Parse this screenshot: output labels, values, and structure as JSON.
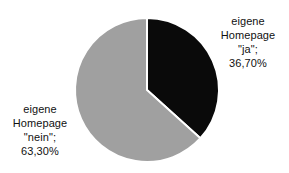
{
  "chart_data": {
    "type": "pie",
    "title": "",
    "subtitle": "",
    "xlabel": "",
    "ylabel": "",
    "grid": false,
    "legend_position": "none",
    "label_style": "callout-text-outside",
    "start_angle_deg": 0,
    "direction": "clockwise",
    "categories": [
      "eigene Homepage \"ja\"",
      "eigene Homepage \"nein\""
    ],
    "values": [
      36.7,
      63.3
    ],
    "value_suffix": "%",
    "decimal_separator": ",",
    "slices": [
      {
        "name": "eigene Homepage \"ja\"",
        "value": 36.7,
        "value_text": "36,70%",
        "color": "#0a0a0a",
        "start_deg": 0,
        "end_deg": 132.12,
        "label_lines": [
          "eigene",
          "Homepage",
          "\"ja\";",
          "36,70%"
        ],
        "label_position": "right"
      },
      {
        "name": "eigene Homepage \"nein\"",
        "value": 63.3,
        "value_text": "63,30%",
        "color": "#a0a0a0",
        "start_deg": 132.12,
        "end_deg": 360,
        "label_lines": [
          "eigene",
          "Homepage",
          "\"nein\";",
          "63,30%"
        ],
        "label_position": "left"
      }
    ]
  },
  "colors": {
    "background": "#ffffff",
    "slice_ja": "#0a0a0a",
    "slice_nein": "#a0a0a0",
    "separator": "#ffffff",
    "text": "#111111"
  },
  "labels": {
    "ja": {
      "line1": "eigene",
      "line2": "Homepage",
      "line3": "\"ja\";",
      "line4": "36,70%"
    },
    "nein": {
      "line1": "eigene",
      "line2": "Homepage",
      "line3": "\"nein\";",
      "line4": "63,30%"
    }
  },
  "geometry": {
    "center_x": 147,
    "center_y": 90,
    "radius": 72
  }
}
